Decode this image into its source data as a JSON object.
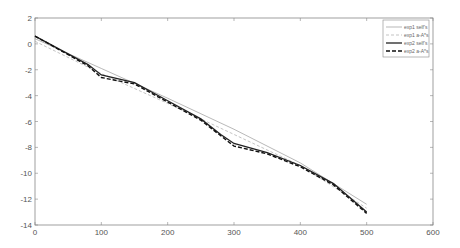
{
  "chart_data": {
    "type": "line",
    "title": "",
    "xlabel": "",
    "ylabel": "",
    "xlim": [
      0,
      600
    ],
    "ylim": [
      -14,
      2
    ],
    "xticks": [
      "0",
      "100",
      "200",
      "300",
      "400",
      "500",
      "600"
    ],
    "yticks": [
      "2",
      "0",
      "-2",
      "-4",
      "-6",
      "-8",
      "-10",
      "-12",
      "-14"
    ],
    "grid": false,
    "legend_position": "top-right",
    "series": [
      {
        "name": "exp1  self's",
        "style": "solid-thin",
        "color": "#999999",
        "x": [
          0,
          100,
          200,
          300,
          400,
          500
        ],
        "y": [
          0.4,
          -1.9,
          -4.2,
          -6.6,
          -9.2,
          -12.4
        ]
      },
      {
        "name": "exp1  a-A*s",
        "style": "dashed-thin",
        "color": "#aaaaaa",
        "x": [
          0,
          100,
          200,
          300,
          400,
          500
        ],
        "y": [
          0.2,
          -2.3,
          -4.6,
          -7.0,
          -9.4,
          -12.7
        ]
      },
      {
        "name": "exp2  self's",
        "style": "solid-thick",
        "color": "#222222",
        "x": [
          0,
          80,
          100,
          150,
          200,
          250,
          280,
          300,
          350,
          400,
          450,
          500
        ],
        "y": [
          0.6,
          -1.6,
          -2.4,
          -3.0,
          -4.4,
          -5.8,
          -7.0,
          -7.7,
          -8.4,
          -9.4,
          -10.8,
          -13.0
        ]
      },
      {
        "name": "exp2  a-A*s",
        "style": "dashed-thick",
        "color": "#111111",
        "x": [
          0,
          80,
          100,
          150,
          200,
          250,
          280,
          300,
          350,
          400,
          450,
          500
        ],
        "y": [
          0.6,
          -1.7,
          -2.6,
          -3.1,
          -4.5,
          -5.9,
          -7.1,
          -7.9,
          -8.5,
          -9.5,
          -10.9,
          -13.1
        ]
      }
    ]
  }
}
